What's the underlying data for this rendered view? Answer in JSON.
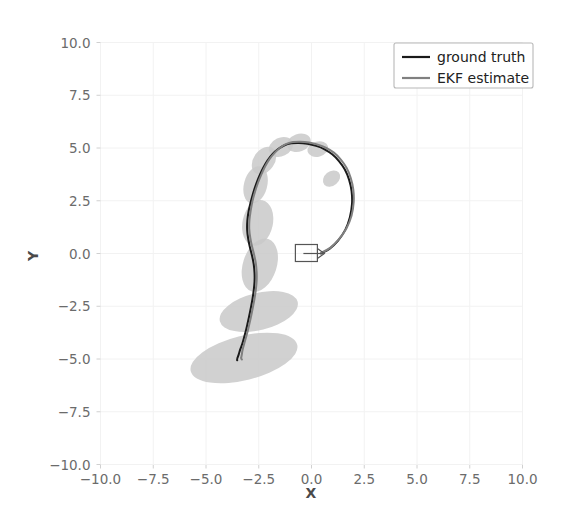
{
  "figure": {
    "background_color": "#ffffff",
    "axis_titles": {
      "x": "X",
      "y": "Y"
    }
  },
  "legend": {
    "position": "upper right",
    "entries": [
      {
        "label": "ground truth",
        "color": "#1a1a1a"
      },
      {
        "label": "EKF estimate",
        "color": "#808080"
      }
    ]
  },
  "chart_data": {
    "type": "line",
    "title": "",
    "xlabel": "X",
    "ylabel": "Y",
    "xlim": [
      -10.0,
      10.0
    ],
    "ylim": [
      -10.0,
      10.0
    ],
    "grid": true,
    "xticks": [
      "-10.0",
      "-7.5",
      "-5.0",
      "-2.5",
      "0.0",
      "2.5",
      "5.0",
      "7.5",
      "10.0"
    ],
    "xtick_values": [
      -10.0,
      -7.5,
      -5.0,
      -2.5,
      0.0,
      2.5,
      5.0,
      7.5,
      10.0
    ],
    "yticks": [
      "10.0",
      "7.5",
      "5.0",
      "2.5",
      "0.0",
      "-2.5",
      "-5.0",
      "-7.5",
      "-10.0"
    ],
    "ytick_values": [
      10.0,
      7.5,
      5.0,
      2.5,
      0.0,
      -2.5,
      -5.0,
      -7.5,
      -10.0
    ],
    "legend_position": "upper right",
    "series": [
      {
        "name": "ground truth",
        "color": "#1a1a1a",
        "linewidth": 2.0,
        "x": [
          0.45,
          0.85,
          1.25,
          1.6,
          1.82,
          1.92,
          1.9,
          1.78,
          1.58,
          1.3,
          0.98,
          0.62,
          0.22,
          -0.2,
          -0.6,
          -0.96,
          -1.3,
          -1.58,
          -1.84,
          -2.08,
          -2.28,
          -2.46,
          -2.62,
          -2.76,
          -2.88,
          -2.98,
          -3.04,
          -3.05,
          -3.0,
          -2.92,
          -2.82,
          -2.74,
          -2.7,
          -2.7,
          -2.74,
          -2.8,
          -2.88,
          -2.96,
          -3.04,
          -3.12,
          -3.2,
          -3.28,
          -3.36,
          -3.42,
          -3.46,
          -3.5,
          -3.52,
          -3.53,
          -3.53,
          -3.52
        ],
        "y": [
          0.0,
          0.22,
          0.6,
          1.12,
          1.72,
          2.35,
          2.95,
          3.5,
          3.98,
          4.38,
          4.7,
          4.94,
          5.1,
          5.2,
          5.24,
          5.22,
          5.12,
          4.95,
          4.72,
          4.42,
          4.08,
          3.7,
          3.3,
          2.88,
          2.44,
          2.0,
          1.56,
          1.12,
          0.7,
          0.3,
          -0.1,
          -0.5,
          -0.92,
          -1.34,
          -1.76,
          -2.18,
          -2.6,
          -3.0,
          -3.36,
          -3.7,
          -4.0,
          -4.28,
          -4.5,
          -4.68,
          -4.82,
          -4.92,
          -4.98,
          -5.02,
          -5.05,
          -5.06
        ]
      },
      {
        "name": "EKF estimate",
        "color": "#808080",
        "linewidth": 2.0,
        "x": [
          0.48,
          0.9,
          1.3,
          1.66,
          1.9,
          2.0,
          1.98,
          1.86,
          1.66,
          1.38,
          1.06,
          0.7,
          0.3,
          -0.12,
          -0.52,
          -0.88,
          -1.22,
          -1.5,
          -1.76,
          -2.0,
          -2.2,
          -2.38,
          -2.54,
          -2.68,
          -2.8,
          -2.88,
          -2.94,
          -2.95,
          -2.9,
          -2.82,
          -2.72,
          -2.64,
          -2.6,
          -2.6,
          -2.64,
          -2.7,
          -2.78,
          -2.86,
          -2.94,
          -3.02,
          -3.1,
          -3.18,
          -3.24,
          -3.28,
          -3.3,
          -3.32,
          -3.33,
          -3.33,
          -3.32,
          -3.3
        ],
        "y": [
          0.04,
          0.28,
          0.68,
          1.2,
          1.8,
          2.44,
          3.04,
          3.58,
          4.06,
          4.46,
          4.78,
          5.0,
          5.16,
          5.26,
          5.3,
          5.28,
          5.18,
          5.0,
          4.76,
          4.46,
          4.12,
          3.74,
          3.34,
          2.92,
          2.48,
          2.04,
          1.6,
          1.16,
          0.74,
          0.34,
          -0.06,
          -0.46,
          -0.88,
          -1.3,
          -1.72,
          -2.14,
          -2.56,
          -2.96,
          -3.32,
          -3.66,
          -3.96,
          -4.24,
          -4.46,
          -4.64,
          -4.78,
          -4.88,
          -4.94,
          -4.98,
          -5.0,
          -5.02
        ]
      }
    ],
    "covariance_ellipses": [
      {
        "cx": -0.6,
        "cy": 5.25,
        "rx": 0.58,
        "ry": 0.42,
        "angle": -20
      },
      {
        "cx": -1.45,
        "cy": 5.05,
        "rx": 0.6,
        "ry": 0.44,
        "angle": -25
      },
      {
        "cx": -2.25,
        "cy": 4.4,
        "rx": 0.72,
        "ry": 0.5,
        "angle": -55
      },
      {
        "cx": -2.65,
        "cy": 3.25,
        "rx": 0.9,
        "ry": 0.55,
        "angle": -75
      },
      {
        "cx": -2.55,
        "cy": 1.45,
        "rx": 1.1,
        "ry": 0.72,
        "angle": -78
      },
      {
        "cx": -2.45,
        "cy": -0.55,
        "rx": 1.3,
        "ry": 0.8,
        "angle": -72
      },
      {
        "cx": -2.5,
        "cy": -2.75,
        "rx": 1.9,
        "ry": 0.88,
        "angle": -14
      },
      {
        "cx": -3.2,
        "cy": -4.95,
        "rx": 2.6,
        "ry": 1.05,
        "angle": -14
      },
      {
        "cx": 0.95,
        "cy": 3.55,
        "rx": 0.45,
        "ry": 0.34,
        "angle": -40
      },
      {
        "cx": 0.3,
        "cy": 4.95,
        "rx": 0.5,
        "ry": 0.36,
        "angle": -15
      }
    ],
    "robot_marker": {
      "x": -0.1,
      "y": 0.0,
      "heading_deg": 0,
      "shape": "rect-with-arrow"
    }
  }
}
